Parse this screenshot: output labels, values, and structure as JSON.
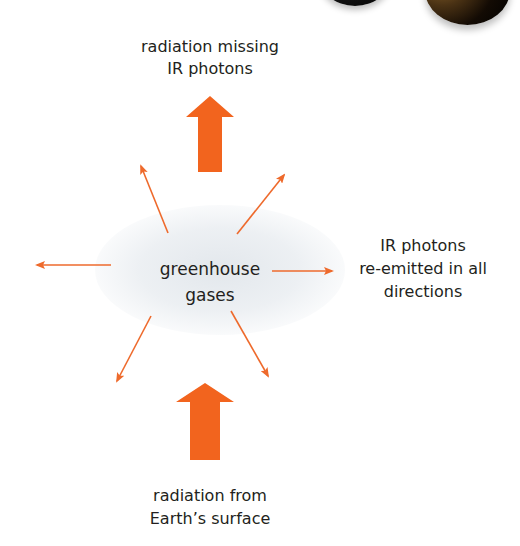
{
  "diagram": {
    "colors": {
      "big_arrow": "#f2641e",
      "thin_arrow": "#ee6a2c",
      "text": "#231f20",
      "cloud": "#e4e8ec"
    },
    "labels": {
      "top_line1": "radiation missing",
      "top_line2": "IR photons",
      "center_line1": "greenhouse",
      "center_line2": "gases",
      "right_line1": "IR photons",
      "right_line2": "re-emitted in all",
      "right_line3": "directions",
      "bottom_line1": "radiation from",
      "bottom_line2": "Earth’s surface"
    },
    "nodes": [
      {
        "id": "greenhouse-gases",
        "label": "greenhouse gases"
      },
      {
        "id": "earth-surface-radiation",
        "label": "radiation from Earth’s surface"
      },
      {
        "id": "outgoing-radiation",
        "label": "radiation missing IR photons"
      },
      {
        "id": "reemitted-photons",
        "label": "IR photons re-emitted in all directions"
      }
    ],
    "edges": [
      {
        "from": "earth-surface-radiation",
        "to": "greenhouse-gases",
        "style": "thick arrow up"
      },
      {
        "from": "greenhouse-gases",
        "to": "outgoing-radiation",
        "style": "thick arrow up"
      },
      {
        "from": "greenhouse-gases",
        "to": "reemitted-photons",
        "style": "thin arrows in 8 directions"
      }
    ]
  }
}
